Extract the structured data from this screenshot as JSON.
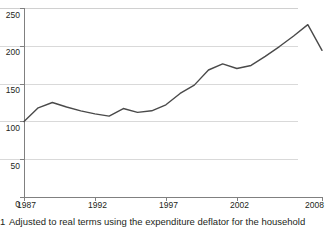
{
  "chart_data": {
    "type": "line",
    "title": "",
    "subtitle": "",
    "xlabel": "",
    "ylabel": "",
    "xlim": [
      1987,
      2008
    ],
    "ylim": [
      0,
      250
    ],
    "grid": true,
    "legend": "none",
    "y_ticks": [
      0,
      50,
      100,
      150,
      200,
      250
    ],
    "x_ticks": [
      1987,
      1992,
      1997,
      2002,
      2008
    ],
    "x_tick_labels": [
      "1987",
      "1992",
      "1997",
      "2002",
      "2008"
    ],
    "y_tick_labels": [
      "0",
      "50",
      "100",
      "150",
      "200",
      "250"
    ],
    "line_color": "#4a4a4a",
    "gridline_color": "#d9d9d9",
    "axis_color": "#808080",
    "x": [
      1987,
      1988,
      1989,
      1990,
      1991,
      1992,
      1993,
      1994,
      1995,
      1996,
      1997,
      1998,
      1999,
      2000,
      2001,
      2002,
      2003,
      2004,
      2005,
      2006,
      2007,
      2008
    ],
    "values": [
      100,
      118,
      125,
      119,
      114,
      110,
      107,
      117,
      112,
      114,
      122,
      137,
      148,
      168,
      176,
      170,
      174,
      186,
      199,
      213,
      228,
      194
    ],
    "series": [
      {
        "name": "index",
        "values": [
          100,
          118,
          125,
          119,
          114,
          110,
          107,
          117,
          112,
          114,
          122,
          137,
          148,
          168,
          176,
          170,
          174,
          186,
          199,
          213,
          228,
          194
        ]
      }
    ]
  },
  "footnote": {
    "marker": "1",
    "text": "Adjusted to real terms using the expenditure deflator for the household"
  }
}
